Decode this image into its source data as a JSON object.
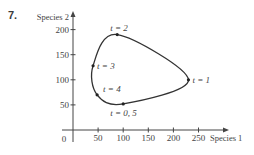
{
  "problem": {
    "number": "7."
  },
  "chart_data": {
    "type": "line",
    "subtype": "parametric phase-plane trajectory (closed curve)",
    "title": "",
    "xlabel": "Species 1",
    "ylabel": "Species 2",
    "xlim": [
      0,
      270
    ],
    "ylim": [
      0,
      210
    ],
    "x_ticks": [
      50,
      100,
      150,
      200,
      250
    ],
    "y_ticks": [
      50,
      100,
      150,
      200
    ],
    "origin_label": "0",
    "grid": false,
    "legend": null,
    "points": [
      {
        "t_label": "t = 0, 5",
        "x": 100,
        "y": 52
      },
      {
        "t_label": "t = 1",
        "x": 230,
        "y": 100
      },
      {
        "t_label": "t = 2",
        "x": 88,
        "y": 190
      },
      {
        "t_label": "t = 3",
        "x": 40,
        "y": 128
      },
      {
        "t_label": "t = 4",
        "x": 48,
        "y": 70
      }
    ],
    "curve_closed": true,
    "colors": {
      "curve": "#333333",
      "axes": "#444444"
    }
  }
}
